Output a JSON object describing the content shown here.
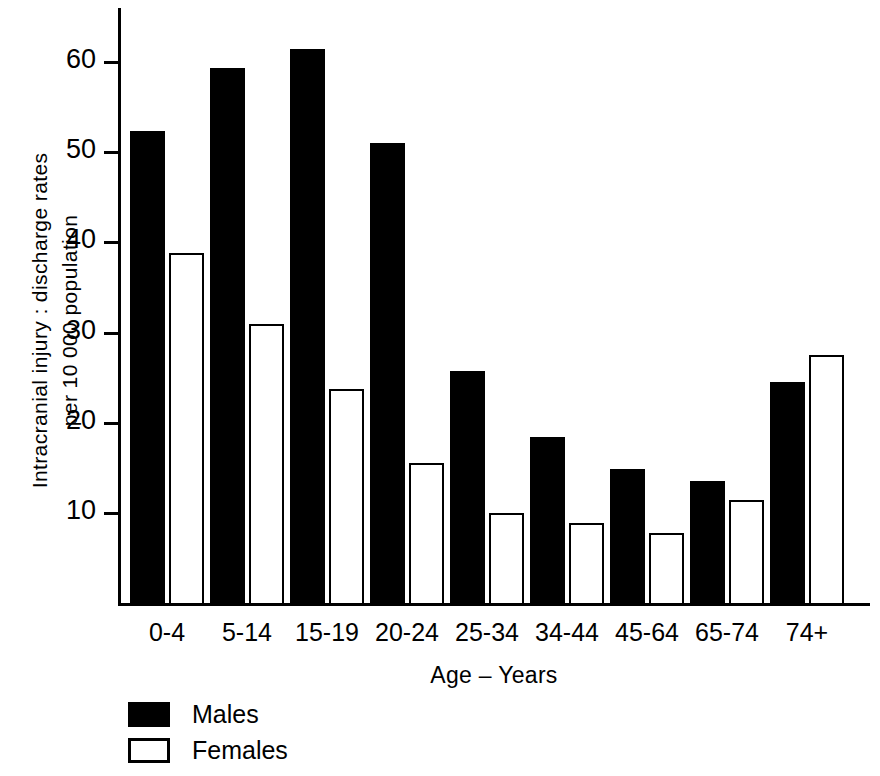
{
  "chart_data": {
    "type": "bar",
    "title": "",
    "subtitle": "",
    "xlabel": "Age – Years",
    "ylabel": "Intracranial injury : discharge rates per 10 000 population",
    "ylabel_lines": [
      "Intracranial injury : discharge rates",
      "per 10 000 population"
    ],
    "categories": [
      "0-4",
      "5-14",
      "15-19",
      "20-24",
      "25-34",
      "34-44",
      "45-64",
      "65-74",
      "74+"
    ],
    "series": [
      {
        "name": "Males",
        "color": "#000000",
        "style": "filled",
        "values": [
          52.4,
          59.4,
          61.4,
          51.0,
          25.7,
          18.4,
          14.9,
          13.5,
          24.5
        ]
      },
      {
        "name": "Females",
        "color": "#ffffff",
        "style": "outlined",
        "values": [
          38.8,
          30.9,
          23.7,
          15.5,
          10.0,
          8.9,
          7.8,
          11.4,
          27.5
        ]
      }
    ],
    "ylim": [
      0,
      66
    ],
    "yticks": [
      10,
      20,
      30,
      40,
      50,
      60
    ],
    "ytick_labels": [
      "10",
      "20",
      "30",
      "40",
      "50",
      "60"
    ],
    "grid": false,
    "legend_position": "below-left",
    "axis_color": "#000000"
  }
}
